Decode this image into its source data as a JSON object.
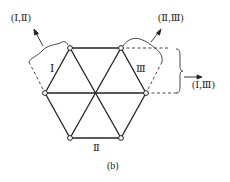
{
  "diagram": {
    "caption": "(b)",
    "regions": {
      "left": "Ⅰ",
      "right": "Ⅲ",
      "bottom": "Ⅱ"
    },
    "pair_labels": {
      "top_left": "(Ⅰ,Ⅱ)",
      "top_right": "(Ⅱ,Ⅲ)",
      "right": "(Ⅰ,Ⅲ)"
    },
    "colors": {
      "line": "#222222",
      "node_fill": "#ffffff"
    }
  }
}
